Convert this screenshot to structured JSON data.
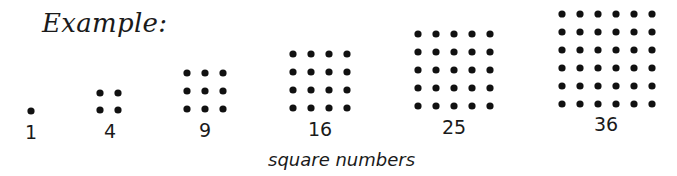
{
  "title": "Example:",
  "caption": "square numbers",
  "dot_color": "#111111",
  "groups": [
    {
      "label": "1",
      "n": 1,
      "x0": 31,
      "y0": 111,
      "dx": 18,
      "dy": 17,
      "label_x": 31,
      "label_y": 121
    },
    {
      "label": "4",
      "n": 2,
      "x0": 100,
      "y0": 93,
      "dx": 18,
      "dy": 17,
      "label_x": 110,
      "label_y": 120
    },
    {
      "label": "9",
      "n": 3,
      "x0": 187,
      "y0": 73,
      "dx": 18,
      "dy": 18,
      "label_x": 205,
      "label_y": 119
    },
    {
      "label": "16",
      "n": 4,
      "x0": 293,
      "y0": 54,
      "dx": 18,
      "dy": 18,
      "label_x": 320,
      "label_y": 118
    },
    {
      "label": "25",
      "n": 5,
      "x0": 418,
      "y0": 34,
      "dx": 18,
      "dy": 18,
      "label_x": 454,
      "label_y": 116
    },
    {
      "label": "36",
      "n": 6,
      "x0": 562,
      "y0": 14,
      "dx": 18,
      "dy": 18,
      "label_x": 606,
      "label_y": 113
    }
  ]
}
